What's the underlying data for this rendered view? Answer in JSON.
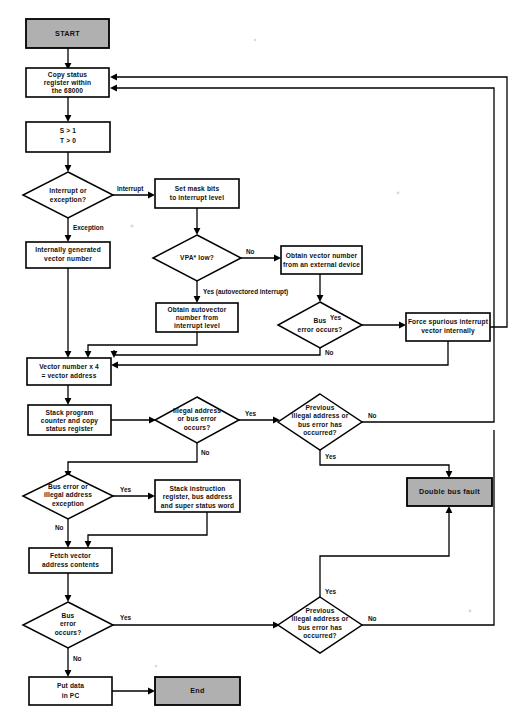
{
  "figure": {
    "type": "flowchart",
    "background_color": "#ffffff",
    "line_color": "#000000",
    "shaded_fill": "#b0b0b0",
    "plain_fill": "#ffffff"
  },
  "nodes": {
    "start": {
      "label": "START",
      "shape": "terminator",
      "fill": "#b0b0b0"
    },
    "copy_status": {
      "line1": "Copy status",
      "line2": "register within",
      "line3": "the 68000",
      "shape": "process"
    },
    "set_flags": {
      "line1": "S > 1",
      "line2": "T > 0",
      "shape": "process"
    },
    "interrupt_or_exception": {
      "line1": "Interrupt or",
      "line2": "exception?",
      "shape": "decision"
    },
    "set_mask_bits": {
      "line1": "Set mask bits",
      "line2": "to interrupt level",
      "shape": "process"
    },
    "internally_generated": {
      "line1": "Internally generated",
      "line2": "vector number",
      "shape": "process"
    },
    "vpa_low": {
      "line1": "VPA* low?",
      "shape": "decision"
    },
    "obtain_vector_external": {
      "line1": "Obtain vector number",
      "line2": "from an external device",
      "shape": "process"
    },
    "obtain_autovector": {
      "line1": "Obtain autovector",
      "line2": "number from",
      "line3": "interrupt level",
      "shape": "process"
    },
    "bus_error_occurs_1": {
      "line1": "Bus",
      "line2": "error occurs?",
      "shape": "decision"
    },
    "force_spurious": {
      "line1": "Force spurious interrupt",
      "line2": "vector internally",
      "shape": "process"
    },
    "vector_address": {
      "line1": "Vector number x 4",
      "line2": "= vector address",
      "shape": "process"
    },
    "stack_pc": {
      "line1": "Stack program",
      "line2": "counter and copy",
      "line3": "status register",
      "shape": "process"
    },
    "illegal_or_bus_error": {
      "line1": "Illegal address",
      "line2": "or bus error",
      "line3": "occurs?",
      "shape": "decision"
    },
    "previous_illegal_1": {
      "line1": "Previous",
      "line2": "illegal address or",
      "line3": "bus error has",
      "line4": "occurred?",
      "shape": "decision"
    },
    "bus_or_illegal_exception": {
      "line1": "Bus error or",
      "line2": "illegal address",
      "line3": "exception",
      "shape": "decision"
    },
    "stack_instruction": {
      "line1": "Stack instruction",
      "line2": "register, bus address",
      "line3": "and super status word",
      "shape": "process"
    },
    "double_bus_fault": {
      "label": "Double bus fault",
      "shape": "terminator",
      "fill": "#b0b0b0"
    },
    "fetch_vector": {
      "line1": "Fetch vector",
      "line2": "address contents",
      "shape": "process"
    },
    "bus_error_occurs_2": {
      "line1": "Bus",
      "line2": "error",
      "line3": "occurs?",
      "shape": "decision"
    },
    "previous_illegal_2": {
      "line1": "Previous",
      "line2": "illegal address or",
      "line3": "bus error has",
      "line4": "occurred?",
      "shape": "decision"
    },
    "put_data_pc": {
      "line1": "Put data",
      "line2": "in PC",
      "shape": "process"
    },
    "end": {
      "label": "End",
      "shape": "terminator",
      "fill": "#b0b0b0"
    }
  },
  "edge_labels": {
    "interrupt": "Interrupt",
    "exception": "Exception",
    "vpa_no": "No",
    "vpa_yes": "Yes (autovectored interrupt)",
    "bus_err1_yes": "Yes",
    "bus_err1_no": "No",
    "illegal_yes": "Yes",
    "illegal_no": "No",
    "prev1_no": "No",
    "prev1_yes": "Yes",
    "bus_ill_yes": "Yes",
    "bus_ill_no": "No",
    "bus_err2_yes": "Yes",
    "bus_err2_no": "No",
    "prev2_no": "No",
    "prev2_yes": "Yes"
  }
}
